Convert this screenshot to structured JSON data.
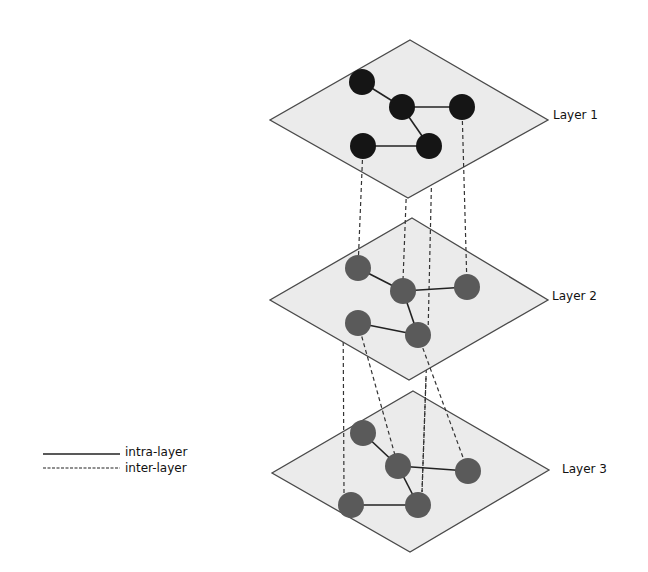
{
  "layers": [
    {
      "label": "Layer 1",
      "node_color": "#151515"
    },
    {
      "label": "Layer 2",
      "node_color": "#5a5a5a"
    },
    {
      "label": "Layer 3",
      "node_color": "#5a5a5a"
    }
  ],
  "legend": {
    "intra_label": "intra-layer",
    "inter_label": "inter-layer"
  },
  "colors": {
    "plane_fill": "#ebebeb",
    "plane_stroke": "#4a4a4a",
    "edge": "#222222"
  }
}
